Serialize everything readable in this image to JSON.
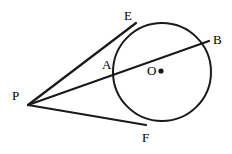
{
  "figure": {
    "background_color": "#ffffff",
    "stroke_color": "#1a1a1a",
    "label_color": "#000000",
    "stroke_width": 2.2,
    "width": 232,
    "height": 154
  },
  "circle": {
    "name": "circle-O",
    "center_x": 162,
    "center_y": 72,
    "radius": 49,
    "stroke_width": 2.0
  },
  "center_dot": {
    "name": "center-point-O",
    "x": 161,
    "y": 71,
    "radius": 2.6
  },
  "points": {
    "P": {
      "label": "P",
      "x": 28,
      "y": 105,
      "label_x": 12,
      "label_y": 89
    },
    "E": {
      "label": "E",
      "x": 131,
      "y": 26,
      "label_x": 124,
      "label_y": 9
    },
    "B": {
      "label": "B",
      "x": 208,
      "y": 41,
      "label_x": 213,
      "label_y": 33
    },
    "A": {
      "label": "A",
      "x": 114,
      "y": 70,
      "label_x": 102,
      "label_y": 58
    },
    "F": {
      "label": "F",
      "x": 141,
      "y": 124,
      "label_x": 142,
      "label_y": 131
    },
    "O": {
      "label": "O",
      "x": 161,
      "y": 71,
      "label_x": 147,
      "label_y": 64
    }
  },
  "segments": [
    {
      "name": "segment-P-E",
      "x1": 28,
      "y1": 105,
      "x2": 136,
      "y2": 23
    },
    {
      "name": "segment-P-B-secant",
      "x1": 28,
      "y1": 105,
      "x2": 209,
      "y2": 41
    },
    {
      "name": "segment-P-F",
      "x1": 28,
      "y1": 105,
      "x2": 146,
      "y2": 125
    }
  ]
}
